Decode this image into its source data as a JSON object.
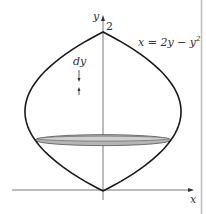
{
  "diagram": {
    "type": "solid-of-revolution",
    "equation_label": "x = 2y − y",
    "equation_exponent": "2",
    "y_axis_label": "y",
    "x_axis_label": "x",
    "y_tick_label": "2",
    "disk_label": "dy",
    "curve": {
      "expression": "x = 2y - y^2",
      "y_range": [
        0,
        2
      ],
      "reflected_about_y_axis": true
    },
    "disk_y": 0.64,
    "colors": {
      "curve": "#1a1a1a",
      "axis": "#555555",
      "disk_fill": "#b5b5b5",
      "disk_stroke": "#555555",
      "border": "#bdbdbd"
    }
  }
}
